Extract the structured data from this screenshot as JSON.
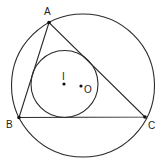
{
  "diagram": {
    "colors": {
      "stroke": "#2a2a2a",
      "background": "#ffffff",
      "text": "#222222"
    },
    "points": {
      "A": {
        "label": "A",
        "x": 49,
        "y": 22.5
      },
      "B": {
        "label": "B",
        "x": 19,
        "y": 117.5
      },
      "C": {
        "label": "C",
        "x": 145,
        "y": 117
      },
      "I": {
        "label": "I",
        "x": 64,
        "y": 84
      },
      "O": {
        "label": "O",
        "x": 81,
        "y": 86
      }
    },
    "circumcircle": {
      "cx": 83,
      "cy": 85.5,
      "r": 71.5
    },
    "incircle": {
      "cx": 64.5,
      "cy": 84,
      "r": 33.5
    },
    "segments": [
      [
        "A",
        "B"
      ],
      [
        "B",
        "C"
      ],
      [
        "C",
        "A"
      ]
    ]
  }
}
